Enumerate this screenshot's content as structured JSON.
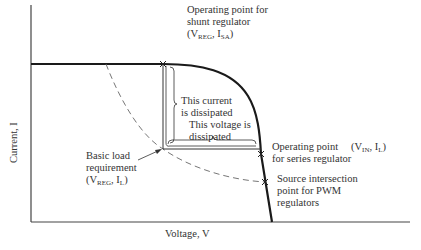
{
  "diagram": {
    "type": "I-V characteristic with regulator operating points",
    "axes": {
      "x_label": "Voltage, V",
      "y_label": "Current, I"
    },
    "annotations": {
      "shunt": {
        "line1": "Operating point for",
        "line2": "shunt regulator",
        "coord_v": "V",
        "coord_v_sub": "REG",
        "coord_i": "I",
        "coord_i_sub": "SA"
      },
      "current_dissipated": {
        "line1": "This current",
        "line2": "is dissipated"
      },
      "voltage_dissipated": {
        "line1": "This voltage is",
        "line2": "dissipated"
      },
      "series": {
        "line1": "Operating point",
        "line2": "for series regulator",
        "coord_v": "V",
        "coord_v_sub": "IN",
        "coord_i": "I",
        "coord_i_sub": "L"
      },
      "load": {
        "line1": "Basic load",
        "line2": "requirement",
        "coord_v": "V",
        "coord_v_sub": "REG",
        "coord_i": "I",
        "coord_i_sub": "L"
      },
      "pwm": {
        "line1": "Source intersection",
        "line2": "point for PWM",
        "line3": "regulators"
      }
    },
    "colors": {
      "curve": "#1a1a1a",
      "axis": "#333333",
      "dashed": "#555555"
    }
  }
}
